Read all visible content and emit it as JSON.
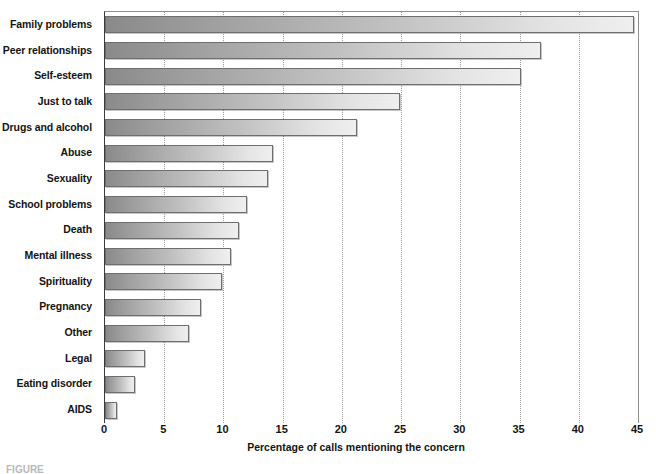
{
  "chart_data": {
    "type": "bar",
    "orientation": "horizontal",
    "title": "",
    "xlabel": "Percentage of calls mentioning the concern",
    "ylabel": "",
    "xlim": [
      0,
      45
    ],
    "xticks": [
      0,
      5,
      10,
      15,
      20,
      25,
      30,
      35,
      40,
      45
    ],
    "grid": true,
    "grid_axis": "x",
    "legend": "none",
    "categories": [
      "Family problems",
      "Peer relationships",
      "Self-esteem",
      "Just to talk",
      "Drugs and alcohol",
      "Abuse",
      "Sexuality",
      "School problems",
      "Death",
      "Mental illness",
      "Spirituality",
      "Pregnancy",
      "Other",
      "Legal",
      "Eating disorder",
      "AIDS"
    ],
    "values": [
      44.7,
      36.8,
      35.1,
      24.9,
      21.3,
      14.2,
      13.8,
      12.0,
      11.3,
      10.6,
      9.9,
      8.1,
      7.1,
      3.4,
      2.5,
      1.0
    ],
    "bar_gradient_start": "#8a8a8a",
    "bar_gradient_end": "#efefef",
    "bar_border_color": "#6e6e6e"
  },
  "axis": {
    "tick_labels": [
      "0",
      "5",
      "10",
      "15",
      "20",
      "25",
      "30",
      "35",
      "40",
      "45"
    ],
    "title": "Percentage of calls mentioning the concern"
  },
  "caption": {
    "text": "FIGURE"
  }
}
